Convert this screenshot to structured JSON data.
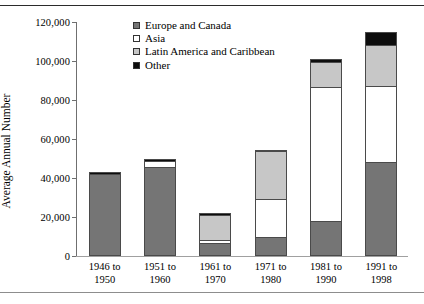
{
  "chart_data": {
    "type": "bar",
    "subtype": "stacked",
    "title": "",
    "xlabel": "",
    "ylabel": "Average Annual Number",
    "ylim": [
      0,
      120000
    ],
    "yticks": [
      0,
      20000,
      40000,
      60000,
      80000,
      100000,
      120000
    ],
    "ytick_labels": [
      "0",
      "20,000",
      "40,000",
      "60,000",
      "80,000",
      "100,000",
      "120,000"
    ],
    "grid": false,
    "legend_position": "upper-left-inside",
    "categories": [
      "1946 to 1950",
      "1951 to 1960",
      "1961 to 1970",
      "1971 to 1980",
      "1981 to 1990",
      "1991 to 1998"
    ],
    "category_lines": [
      {
        "line1": "1946 to",
        "line2": "1950"
      },
      {
        "line1": "1951 to",
        "line2": "1960"
      },
      {
        "line1": "1961 to",
        "line2": "1970"
      },
      {
        "line1": "1971 to",
        "line2": "1980"
      },
      {
        "line1": "1981 to",
        "line2": "1990"
      },
      {
        "line1": "1991 to",
        "line2": "1998"
      }
    ],
    "series": [
      {
        "name": "Europe and Canada",
        "color": "#757575",
        "values": [
          42000,
          45500,
          6000,
          8800,
          17000,
          47500
        ]
      },
      {
        "name": "Asia",
        "color": "#ffffff",
        "values": [
          0,
          3200,
          1500,
          20200,
          69500,
          39500
        ]
      },
      {
        "name": "Latin America and Caribbean",
        "color": "#c7c7c7",
        "values": [
          0,
          0,
          13500,
          25000,
          13000,
          21000
        ]
      },
      {
        "name": "Other",
        "color": "#0d0d0d",
        "values": [
          1000,
          1000,
          1000,
          500,
          1500,
          7000
        ]
      }
    ],
    "totals": [
      43000,
      49700,
      22000,
      54500,
      101000,
      115000
    ]
  },
  "legend": {
    "items": [
      {
        "label": "Europe and Canada",
        "swatch": "europe"
      },
      {
        "label": "Asia",
        "swatch": "asia"
      },
      {
        "label": "Latin America and Caribbean",
        "swatch": "latin"
      },
      {
        "label": "Other",
        "swatch": "other"
      }
    ]
  }
}
